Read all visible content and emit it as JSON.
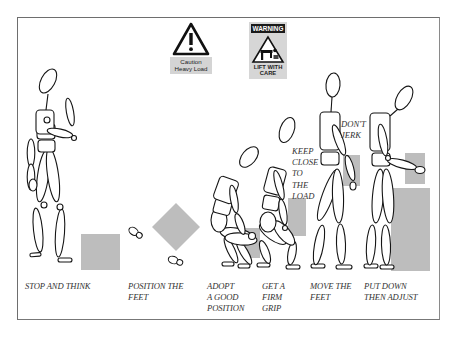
{
  "signs": {
    "caution": {
      "icon": "exclamation-triangle-icon",
      "line1": "Caution",
      "line2": "Heavy Load"
    },
    "warning": {
      "header": "WARNING",
      "icon": "lifting-person-triangle-icon",
      "line1": "LIFT WITH",
      "line2": "CARE"
    }
  },
  "steps": [
    {
      "lines": [
        "STOP AND THINK"
      ]
    },
    {
      "lines": [
        "POSITION THE",
        "FEET"
      ]
    },
    {
      "lines": [
        "ADOPT",
        "A GOOD",
        "POSITION"
      ]
    },
    {
      "lines": [
        "GET A",
        "FIRM",
        "GRIP"
      ]
    },
    {
      "lines": [
        "MOVE THE",
        "FEET"
      ]
    },
    {
      "lines": [
        "PUT DOWN",
        "THEN ADJUST"
      ]
    }
  ],
  "callouts": {
    "keep_close": [
      "KEEP",
      "CLOSE",
      "TO",
      "THE",
      "LOAD"
    ],
    "dont_jerk": [
      "DON'T",
      "JERK"
    ]
  },
  "colors": {
    "load_box": "#bdbdbd",
    "frame": "#6e6e6e",
    "figure_stroke": "#1a1a1a"
  }
}
